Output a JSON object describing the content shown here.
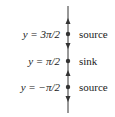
{
  "diagram": {
    "type": "phase-line",
    "equilibria": [
      {
        "equation": "y = 3π/2",
        "classification": "source",
        "y_px": 34
      },
      {
        "equation": "y = π/2",
        "classification": "sink",
        "y_px": 61
      },
      {
        "equation": "y = −π/2",
        "classification": "source",
        "y_px": 87
      }
    ],
    "arrows": [
      {
        "region": "above 3π/2",
        "direction": "up"
      },
      {
        "region": "between π/2 and 3π/2",
        "direction": "down"
      },
      {
        "region": "between −π/2 and π/2",
        "direction": "up"
      },
      {
        "region": "below −π/2",
        "direction": "down"
      }
    ],
    "colors": {
      "line": "#333333",
      "text": "#222222"
    }
  }
}
